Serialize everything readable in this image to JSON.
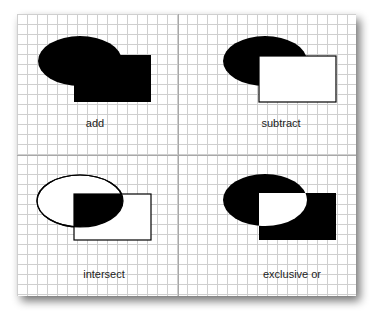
{
  "figure": {
    "width": 374,
    "height": 317,
    "paper": {
      "x": 17,
      "y": 14,
      "width": 339,
      "height": 282,
      "fill": "#ffffff"
    },
    "shadow_color": "#000000",
    "grid": {
      "spacing": 10,
      "origin_x": 17,
      "origin_y": 14,
      "minor_color": "#cfcfcf",
      "major_color": "#a8a8a8",
      "major_x": [
        178
      ],
      "major_y": [
        155
      ]
    },
    "fill_color": "#000000",
    "stroke_color": "#000000",
    "panels": [
      {
        "id": "add",
        "label": "add",
        "label_x": 95,
        "label_y": 127,
        "ellipse": {
          "cx": 80,
          "cy": 61,
          "rx": 42,
          "ry": 25
        },
        "rect": {
          "x": 74,
          "y": 55,
          "width": 77,
          "height": 47
        }
      },
      {
        "id": "subtract",
        "label": "subtract",
        "label_x": 281,
        "label_y": 127,
        "ellipse": {
          "cx": 265,
          "cy": 61,
          "rx": 42,
          "ry": 25
        },
        "rect": {
          "x": 259,
          "y": 56,
          "width": 77,
          "height": 46
        }
      },
      {
        "id": "intersect",
        "label": "intersect",
        "label_x": 104,
        "label_y": 278,
        "ellipse": {
          "cx": 80,
          "cy": 201,
          "rx": 43,
          "ry": 26
        },
        "rect": {
          "x": 74,
          "y": 194,
          "width": 77,
          "height": 46
        }
      },
      {
        "id": "exclusive-or",
        "label": "exclusive or",
        "label_x": 292,
        "label_y": 278,
        "ellipse": {
          "cx": 265,
          "cy": 200,
          "rx": 42,
          "ry": 26
        },
        "rect": {
          "x": 259,
          "y": 193,
          "width": 77,
          "height": 47
        }
      }
    ]
  }
}
